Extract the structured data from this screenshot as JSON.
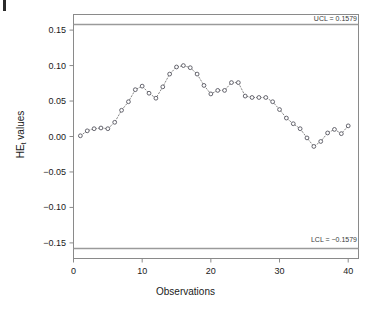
{
  "chart_data": {
    "type": "scatter",
    "title": "",
    "xlabel": "Observations",
    "ylabel": "HE",
    "ylabel_sub": "t",
    "ylabel_suffix": " values",
    "xlim": [
      0,
      41.5
    ],
    "ylim": [
      -0.172,
      0.172
    ],
    "xticks": [
      0,
      10,
      20,
      30,
      40
    ],
    "yticks": [
      0.15,
      0.1,
      0.05,
      0.0,
      -0.05,
      -0.1,
      -0.15
    ],
    "ytick_labels": [
      "0.15",
      "0.10",
      "0.05",
      "0.00",
      "−0.05",
      "−0.10",
      "−0.15"
    ],
    "xtick_labels": [
      "0",
      "10",
      "20",
      "30",
      "40"
    ],
    "grid": false,
    "legend": "none",
    "marker": "open-circle",
    "line_style": "dotted",
    "line_color": "#7a7a7a",
    "marker_color": "#55555f",
    "frame_color": "#8a8a8a",
    "control_limits": {
      "ucl": 0.1579,
      "lcl": -0.1579,
      "ucl_label": "UCL = 0.1579",
      "lcl_label": "LCL = −0.1579",
      "line_color": "#9a9a9a"
    },
    "x": [
      1,
      2,
      3,
      4,
      5,
      6,
      7,
      8,
      9,
      10,
      11,
      12,
      13,
      14,
      15,
      16,
      17,
      18,
      19,
      20,
      21,
      22,
      23,
      24,
      25,
      26,
      27,
      28,
      29,
      30,
      31,
      32,
      33,
      34,
      35,
      36,
      37,
      38,
      39,
      40
    ],
    "values": [
      0.001,
      0.008,
      0.011,
      0.012,
      0.011,
      0.02,
      0.037,
      0.049,
      0.066,
      0.071,
      0.061,
      0.054,
      0.07,
      0.088,
      0.098,
      0.1,
      0.097,
      0.088,
      0.072,
      0.06,
      0.065,
      0.065,
      0.076,
      0.076,
      0.057,
      0.055,
      0.055,
      0.055,
      0.049,
      0.038,
      0.026,
      0.018,
      0.011,
      -0.002,
      -0.014,
      -0.007,
      0.005,
      0.01,
      0.004,
      0.015
    ]
  }
}
